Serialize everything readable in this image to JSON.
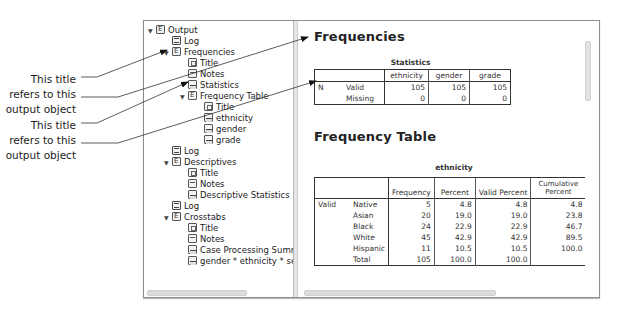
{
  "callouts": [
    {
      "lines": [
        "This title",
        "refers to this",
        "output object"
      ]
    },
    {
      "lines": [
        "This title",
        "refers to this",
        "output object"
      ]
    }
  ],
  "tree": {
    "items": [
      {
        "label": "Output",
        "icon": "book",
        "level": 0,
        "expanded": true
      },
      {
        "label": "Log",
        "icon": "log",
        "level": 1
      },
      {
        "label": "Frequencies",
        "icon": "book",
        "level": 1,
        "expanded": true
      },
      {
        "label": "Title",
        "icon": "title",
        "level": 2
      },
      {
        "label": "Notes",
        "icon": "notes",
        "level": 2
      },
      {
        "label": "Statistics",
        "icon": "table",
        "level": 2
      },
      {
        "label": "Frequency Table",
        "icon": "book",
        "level": 2,
        "expanded": true
      },
      {
        "label": "Title",
        "icon": "title",
        "level": 3
      },
      {
        "label": "ethnicity",
        "icon": "table",
        "level": 3
      },
      {
        "label": "gender",
        "icon": "table",
        "level": 3
      },
      {
        "label": "grade",
        "icon": "table",
        "level": 3
      },
      {
        "label": "Log",
        "icon": "log",
        "level": 1
      },
      {
        "label": "Descriptives",
        "icon": "book",
        "level": 1,
        "expanded": true
      },
      {
        "label": "Title",
        "icon": "title",
        "level": 2
      },
      {
        "label": "Notes",
        "icon": "notes",
        "level": 2
      },
      {
        "label": "Descriptive Statistics",
        "icon": "table",
        "level": 2
      },
      {
        "label": "Log",
        "icon": "log",
        "level": 1
      },
      {
        "label": "Crosstabs",
        "icon": "book",
        "level": 1,
        "expanded": true
      },
      {
        "label": "Title",
        "icon": "title",
        "level": 2
      },
      {
        "label": "Notes",
        "icon": "notes",
        "level": 2
      },
      {
        "label": "Case Processing Summar",
        "icon": "table",
        "level": 2
      },
      {
        "label": "gender * ethnicity * secti",
        "icon": "table",
        "level": 2
      }
    ]
  },
  "content": {
    "heading1": "Frequencies",
    "statistics": {
      "caption": "Statistics",
      "columns": [
        "",
        "",
        "ethnicity",
        "gender",
        "grade"
      ],
      "rows": [
        [
          "N",
          "Valid",
          "105",
          "105",
          "105"
        ],
        [
          "",
          "Missing",
          "0",
          "0",
          "0"
        ]
      ]
    },
    "heading2": "Frequency Table",
    "ethnicity": {
      "caption": "ethnicity",
      "columns": [
        "",
        "",
        "Frequency",
        "Percent",
        "Valid Percent",
        "Cumulative Percent"
      ],
      "rows": [
        [
          "Valid",
          "Native",
          "5",
          "4.8",
          "4.8",
          "4.8"
        ],
        [
          "",
          "Asian",
          "20",
          "19.0",
          "19.0",
          "23.8"
        ],
        [
          "",
          "Black",
          "24",
          "22.9",
          "22.9",
          "46.7"
        ],
        [
          "",
          "White",
          "45",
          "42.9",
          "42.9",
          "89.5"
        ],
        [
          "",
          "Hispanic",
          "11",
          "10.5",
          "10.5",
          "100.0"
        ],
        [
          "",
          "Total",
          "105",
          "100.0",
          "100.0",
          ""
        ]
      ]
    }
  },
  "colors": {
    "frame_border": "#8e8e8e",
    "text": "#222222",
    "scrollbar": "#dcdcdc"
  }
}
